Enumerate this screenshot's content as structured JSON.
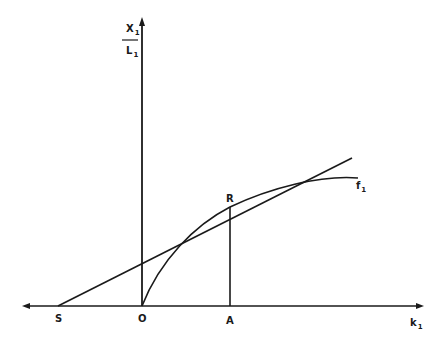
{
  "diagram": {
    "y_axis_label": {
      "numerator": "X",
      "numerator_sub": "1",
      "denominator": "L",
      "denominator_sub": "1"
    },
    "x_axis_label": {
      "text": "k",
      "sub": "1"
    },
    "curve_label": {
      "text": "f",
      "sub": "1"
    },
    "points": {
      "S": "S",
      "O": "O",
      "A": "A",
      "R": "R"
    },
    "elements": [
      "x-axis arrow",
      "y-axis arrow",
      "tangent line S-R",
      "production curve f1 from O through R",
      "vertical line A-R"
    ],
    "colors": {
      "ink": "#1a1a1a",
      "background": "#ffffff"
    }
  }
}
